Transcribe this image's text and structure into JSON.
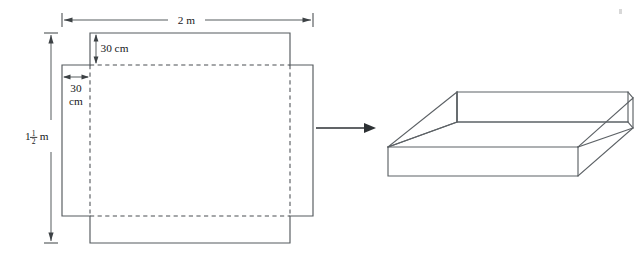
{
  "figure": {
    "net": {
      "sheet_width_label": "2 m",
      "sheet_height_label_integer": "1",
      "sheet_height_fraction_numerator": "1",
      "sheet_height_fraction_denominator": "2",
      "sheet_height_unit": "m",
      "top_flap_label": "30 cm",
      "left_flap_label_line1": "30",
      "left_flap_label_line2": "cm"
    },
    "transform_arrow": {
      "icon": "right-arrow-icon",
      "meaning": "folds into"
    },
    "box": {
      "description": "open-topped rectangular box in oblique projection"
    }
  },
  "colors": {
    "line": "#555a5e",
    "fold": "#4a4f53",
    "dimension": "#4d5255",
    "arrow": "#2d3134",
    "text": "#17191b",
    "background": "#ffffff"
  }
}
